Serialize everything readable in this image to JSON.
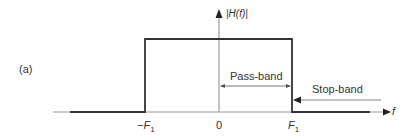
{
  "figure": {
    "panel_label": "(a)",
    "y_axis_label": "|H(f)|",
    "x_axis_label": "f",
    "ticks": [
      {
        "label": "−F",
        "sub": "1",
        "x": 145
      },
      {
        "label": "0",
        "sub": "",
        "x": 219
      },
      {
        "label": "F",
        "sub": "1",
        "x": 292
      }
    ],
    "annotations": {
      "pass_band": "Pass-band",
      "stop_band": "Stop-band"
    },
    "colors": {
      "response_line": "#333333",
      "axis_line": "#8a8a8a",
      "text": "#333333"
    },
    "response": {
      "type": "ideal-lowpass",
      "passband_edges": [
        "-F1",
        "F1"
      ],
      "gain_passband": 1,
      "gain_stopband": 0
    }
  }
}
